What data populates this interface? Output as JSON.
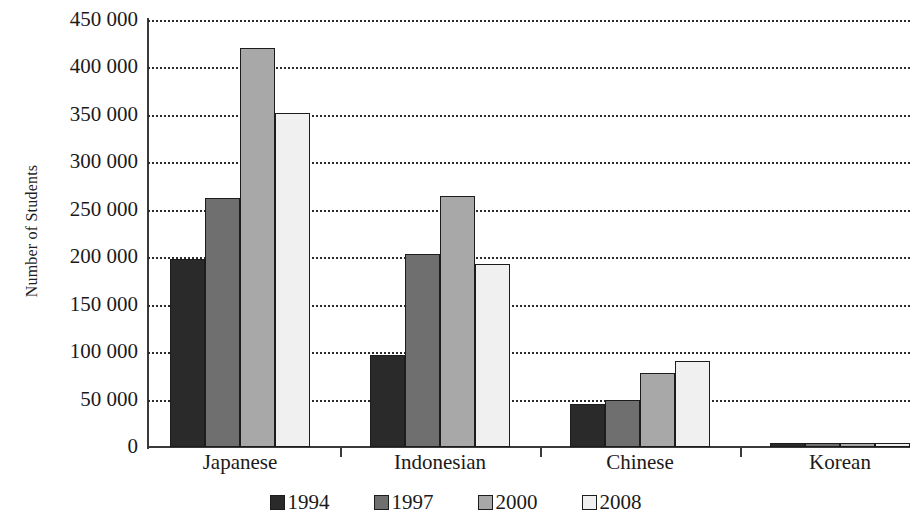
{
  "chart_data": {
    "type": "bar",
    "title": "",
    "xlabel": "",
    "ylabel": "Number of Students",
    "categories": [
      "Japanese",
      "Indonesian",
      "Chinese",
      "Korean"
    ],
    "series": [
      {
        "name": "1994",
        "color": "#2a2a2a",
        "values": [
          198000,
          97000,
          45000,
          4000
        ]
      },
      {
        "name": "1997",
        "color": "#6f6f6f",
        "values": [
          262000,
          203000,
          50000,
          4000
        ]
      },
      {
        "name": "2000",
        "color": "#a8a8a8",
        "values": [
          421000,
          265000,
          78000,
          4000
        ]
      },
      {
        "name": "2008",
        "color": "#f0f0f0",
        "values": [
          352000,
          193000,
          91000,
          4000
        ]
      }
    ],
    "ylim": [
      0,
      450000
    ],
    "ytick_values": [
      0,
      50000,
      100000,
      150000,
      200000,
      250000,
      300000,
      350000,
      400000,
      450000
    ],
    "ytick_labels": [
      "0",
      "50 000",
      "100 000",
      "150 000",
      "200 000",
      "250 000",
      "300 000",
      "350 000",
      "400 000",
      "450 000"
    ],
    "grid": true,
    "grid_style": "dotted",
    "legend_position": "bottom"
  },
  "legend": {
    "items": [
      {
        "label": "1994",
        "color": "#2a2a2a"
      },
      {
        "label": "1997",
        "color": "#6f6f6f"
      },
      {
        "label": "2000",
        "color": "#a8a8a8"
      },
      {
        "label": "2008",
        "color": "#f0f0f0"
      }
    ]
  },
  "axes": {
    "y_title": "Number of Students"
  }
}
